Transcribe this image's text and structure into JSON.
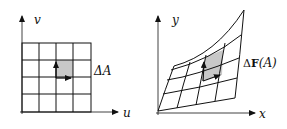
{
  "left_diagram": {
    "axis_x_label": "u",
    "axis_y_label": "v",
    "region_label": "ΔA",
    "grid": {
      "rows": 4,
      "cols": 4,
      "highlighted_cell": {
        "row": 1,
        "col": 2
      }
    },
    "fill_color": "#c8c8c8"
  },
  "right_diagram": {
    "axis_x_label": "x",
    "axis_y_label": "y",
    "region_label_delta": "Δ",
    "region_label_bold": "F",
    "region_label_arg": "(A)",
    "grid": {
      "rows": 4,
      "cols": 4,
      "highlighted_cell": {
        "row": 1,
        "col": 2
      }
    },
    "fill_color": "#c8c8c8"
  }
}
